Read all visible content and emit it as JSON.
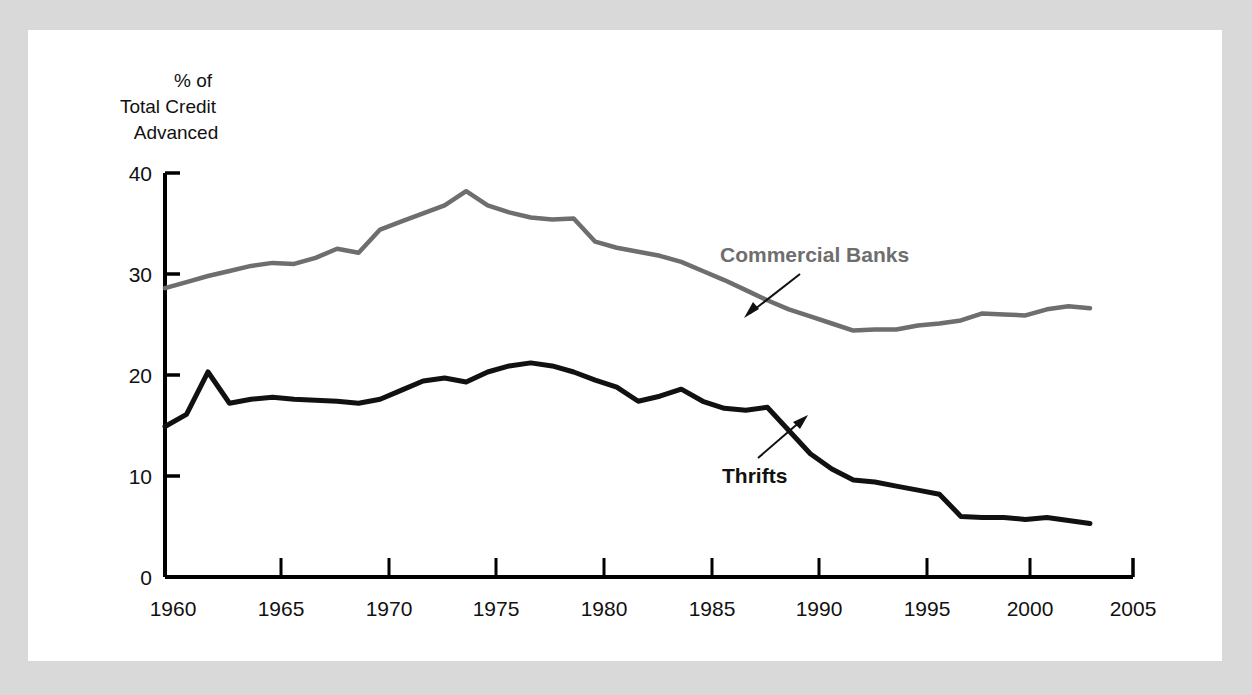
{
  "figure": {
    "background_color": "#d9d9d9",
    "panel_color": "#ffffff",
    "axis_color": "#000000"
  },
  "axis_title": {
    "line1": "% of",
    "line2": "Total Credit",
    "line3": "Advanced"
  },
  "annotations": {
    "commercial_banks": {
      "label": "Commercial Banks",
      "color": "#6e6e6e"
    },
    "thrifts": {
      "label": "Thrifts",
      "color": "#111111"
    }
  },
  "chart_data": {
    "type": "line",
    "title": "",
    "xlabel": "",
    "ylabel": "% of Total Credit Advanced",
    "xlim": [
      1960,
      2005
    ],
    "ylim": [
      0,
      40
    ],
    "xticks": [
      1960,
      1965,
      1970,
      1975,
      1980,
      1985,
      1990,
      1995,
      2000,
      2005
    ],
    "xtick_labels": [
      "1960",
      "1965",
      "1970",
      "1975",
      "1980",
      "1985",
      "1990",
      "1995",
      "2000",
      "2005"
    ],
    "yticks": [
      0,
      10,
      20,
      30,
      40
    ],
    "ytick_labels": [
      "0",
      "10",
      "20",
      "30",
      "40"
    ],
    "grid": false,
    "legend": "annotated-inline",
    "x": [
      1960,
      1961,
      1962,
      1963,
      1964,
      1965,
      1966,
      1967,
      1968,
      1969,
      1970,
      1971,
      1972,
      1973,
      1974,
      1975,
      1976,
      1977,
      1978,
      1979,
      1980,
      1981,
      1982,
      1983,
      1984,
      1985,
      1986,
      1987,
      1988,
      1989,
      1990,
      1991,
      1992,
      1993,
      1994,
      1995,
      1996,
      1997,
      1998,
      1999,
      2000,
      2001,
      2002,
      2003
    ],
    "series": [
      {
        "name": "Commercial Banks",
        "color": "#6e6e6e",
        "width": 4.5,
        "values": [
          28.6,
          29.2,
          29.8,
          30.3,
          30.8,
          31.1,
          31.0,
          31.6,
          32.5,
          32.1,
          34.4,
          35.2,
          36.0,
          36.8,
          38.2,
          36.8,
          36.1,
          35.6,
          35.4,
          35.5,
          33.2,
          32.6,
          32.2,
          31.8,
          31.2,
          30.3,
          29.4,
          28.4,
          27.4,
          26.5,
          25.8,
          25.1,
          24.4,
          24.5,
          24.5,
          24.9,
          25.1,
          25.4,
          26.1,
          26.0,
          25.9,
          26.5,
          26.8,
          26.6
        ]
      },
      {
        "name": "Thrifts",
        "color": "#111111",
        "width": 5,
        "values": [
          14.9,
          16.1,
          20.3,
          17.2,
          17.6,
          17.8,
          17.6,
          17.5,
          17.4,
          17.2,
          17.6,
          18.5,
          19.4,
          19.7,
          19.3,
          20.3,
          20.9,
          21.2,
          20.9,
          20.3,
          19.5,
          18.8,
          17.4,
          17.9,
          18.6,
          17.4,
          16.7,
          16.5,
          16.8,
          14.5,
          12.2,
          10.7,
          9.6,
          9.4,
          9.0,
          8.6,
          8.2,
          6.0,
          5.9,
          5.9,
          5.7,
          5.9,
          5.6,
          5.3
        ]
      }
    ]
  }
}
